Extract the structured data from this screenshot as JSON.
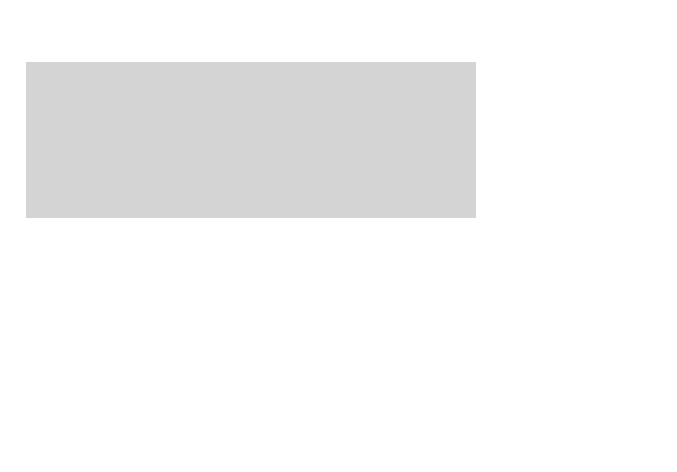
{
  "map": {
    "title": "",
    "colors": {
      "background": "#ffffff",
      "water": "#d4d4d4",
      "us_land": "#ececec",
      "foreign_land": "#b8b8b8",
      "lakes": "#c4c4c4",
      "border": "#333333",
      "abbr_text": "#222222",
      "value_text": "#6e6e6e"
    },
    "states": [
      {
        "abbr": "WA",
        "value": "15"
      },
      {
        "abbr": "OR",
        "value": "10"
      },
      {
        "abbr": "CA",
        "value": "60"
      },
      {
        "abbr": "ID",
        "value": "9"
      },
      {
        "abbr": "NV",
        "value": "15"
      },
      {
        "abbr": "MT",
        "value": "12"
      },
      {
        "abbr": "WY",
        "value": "4"
      },
      {
        "abbr": "UT",
        "value": "6"
      },
      {
        "abbr": "AZ",
        "value": "16"
      },
      {
        "abbr": "CO",
        "value": "17"
      },
      {
        "abbr": "NM",
        "value": "2"
      },
      {
        "abbr": "ND",
        "value": "1"
      },
      {
        "abbr": "SD",
        "value": "12.0%"
      },
      {
        "abbr": "NE",
        "value": "4"
      },
      {
        "abbr": "KS",
        "value": "6"
      },
      {
        "abbr": "OK",
        "value": "15"
      },
      {
        "abbr": "TX",
        "value": "66"
      },
      {
        "abbr": "MN",
        "value": "9"
      },
      {
        "abbr": "IA",
        "value": "10.8%"
      },
      {
        "abbr": "MO",
        "value": "31"
      },
      {
        "abbr": "AR",
        "value": "24"
      },
      {
        "abbr": "LA",
        "value": "28"
      },
      {
        "abbr": "WI",
        "value": "8"
      },
      {
        "abbr": "IL",
        "value": "28"
      },
      {
        "abbr": "MI",
        "value": "26"
      },
      {
        "abbr": "IN",
        "value": "17"
      },
      {
        "abbr": "OH",
        "value": "27"
      },
      {
        "abbr": "KY",
        "value": "10"
      },
      {
        "abbr": "TN",
        "value": "37"
      },
      {
        "abbr": "MS",
        "value": "25"
      },
      {
        "abbr": "AL",
        "value": "32"
      },
      {
        "abbr": "GA",
        "value": "37"
      },
      {
        "abbr": "FL",
        "value": "51"
      },
      {
        "abbr": "SC",
        "value": "36"
      },
      {
        "abbr": "NC",
        "value": "29"
      },
      {
        "abbr": "VA",
        "value": "22"
      },
      {
        "abbr": "WV",
        "value": "13"
      },
      {
        "abbr": "PA",
        "value": "28"
      },
      {
        "abbr": "NY",
        "value": "31"
      },
      {
        "abbr": "VT",
        "value": "1"
      },
      {
        "abbr": "NH",
        "value": "5"
      },
      {
        "abbr": "ME",
        "value": "2"
      },
      {
        "abbr": "MA",
        "value": "16"
      },
      {
        "abbr": "RI",
        "value": "3"
      },
      {
        "abbr": "CT",
        "value": "6"
      },
      {
        "abbr": "NJ",
        "value": "44"
      },
      {
        "abbr": "DE",
        "value": "4"
      },
      {
        "abbr": "DC",
        "value": "9"
      },
      {
        "abbr": "MD",
        "value": "13"
      }
    ]
  }
}
